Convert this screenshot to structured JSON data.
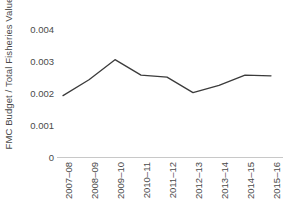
{
  "chart_data": {
    "type": "line",
    "title": "",
    "xlabel": "",
    "ylabel": "FMC Budget / Total Fisheries Value",
    "categories": [
      "2007–08",
      "2008–09",
      "2009–10",
      "2010–11",
      "2011–12",
      "2012–13",
      "2013–14",
      "2014–15",
      "2015–16"
    ],
    "values": [
      0.00186,
      0.00234,
      0.00295,
      0.00248,
      0.00242,
      0.00195,
      0.00217,
      0.00248,
      0.00246
    ],
    "ylim": [
      0,
      0.0045
    ],
    "yticks": [
      0,
      0.001,
      0.002,
      0.003,
      0.004
    ],
    "ytick_labels": [
      "0",
      "0.001",
      "0.002",
      "0.003",
      "0.004"
    ],
    "grid": false,
    "legend": false,
    "series_color": "#3b3b3b",
    "axis_color": "#c8c8c8",
    "text_color": "#4a4a4a"
  }
}
